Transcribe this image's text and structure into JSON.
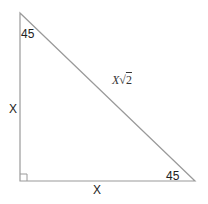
{
  "diagram": {
    "type": "right-isosceles-triangle",
    "vertices": {
      "top": [
        20,
        13
      ],
      "bottom_left": [
        20,
        181
      ],
      "bottom_right": [
        195,
        181
      ]
    },
    "labels": {
      "top_angle": "45",
      "bottom_right_angle": "45",
      "left_side": "X",
      "bottom_side": "X",
      "hypotenuse_var": "X",
      "hypotenuse_radical": "√",
      "hypotenuse_radicand": "2"
    },
    "right_angle_marker": true,
    "colors": {
      "line": "#9a9a9a",
      "text": "#222222"
    }
  }
}
